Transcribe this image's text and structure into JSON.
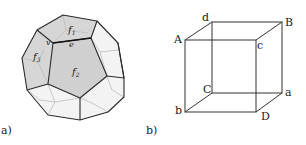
{
  "figure": {
    "panel_a": {
      "label": "a)",
      "shape": "dodecahedron",
      "face_labels": {
        "f1": "f",
        "f1_sub": "1",
        "f2": "f",
        "f2_sub": "2",
        "f3": "f",
        "f3_sub": "3"
      },
      "vertex_label": "v",
      "edge_label": "e",
      "colors": {
        "shaded_face": "#d4d4d4",
        "light_face": "#f2f2f2",
        "edge": "#2a2a2a",
        "hidden_edge": "#b8b8b8"
      }
    },
    "panel_b": {
      "label": "b)",
      "shape": "cube",
      "vertex_labels": {
        "front_top_left": "A",
        "back_top_left": "d",
        "back_top_right": "B",
        "front_top_right": "c",
        "back_bottom_left": "C",
        "back_bottom_right": "a",
        "front_bottom_left": "b",
        "front_bottom_right": "D"
      },
      "colors": {
        "edge": "#333333"
      }
    }
  }
}
